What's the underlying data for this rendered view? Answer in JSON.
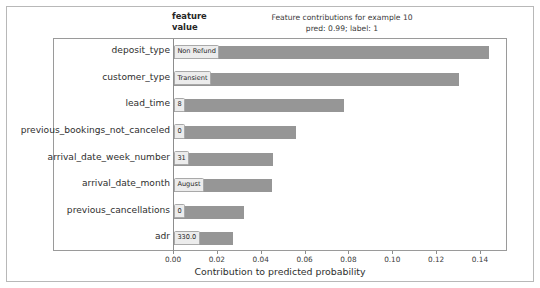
{
  "figure": {
    "header_feature_value": "feature\nvalue",
    "title_line1": "Feature contributions for example 10",
    "title_line2": "pred: 0.99; label: 1",
    "xlabel": "Contribution to predicted probability",
    "bar_color": "#969696",
    "value_box_bg": "#ececec",
    "value_box_border": "#a9a9a9",
    "axis_color": "#8d8d8d",
    "frame_color": "#b8b8b8"
  },
  "chart_data": {
    "type": "bar",
    "orientation": "horizontal",
    "title": "Feature contributions for example 10\npred: 0.99; label: 1",
    "xlabel": "Contribution to predicted probability",
    "ylabel": "",
    "xlim": [
      0.0,
      0.1505
    ],
    "grid": false,
    "legend": null,
    "xticks": [
      "0.00",
      "0.02",
      "0.04",
      "0.06",
      "0.08",
      "0.10",
      "0.12",
      "0.14"
    ],
    "xtick_values": [
      0.0,
      0.02,
      0.04,
      0.06,
      0.08,
      0.1,
      0.12,
      0.14
    ],
    "categories": [
      "deposit_type",
      "customer_type",
      "lead_time",
      "previous_bookings_not_canceled",
      "arrival_date_week_number",
      "arrival_date_month",
      "previous_cancellations",
      "adr"
    ],
    "values": [
      0.1435,
      0.13,
      0.0775,
      0.0557,
      0.045,
      0.0448,
      0.0321,
      0.027
    ],
    "feature_values": [
      "Non Refund",
      "Transient",
      "8",
      "0",
      "31",
      "August",
      "0",
      "330.0"
    ],
    "prediction": "0.99",
    "label": "1",
    "example_index": "10"
  },
  "rows": [
    {
      "feature": "deposit_type",
      "value": "Non Refund",
      "contribution": 0.1435
    },
    {
      "feature": "customer_type",
      "value": "Transient",
      "contribution": 0.13
    },
    {
      "feature": "lead_time",
      "value": "8",
      "contribution": 0.0775
    },
    {
      "feature": "previous_bookings_not_canceled",
      "value": "0",
      "contribution": 0.0557
    },
    {
      "feature": "arrival_date_week_number",
      "value": "31",
      "contribution": 0.045
    },
    {
      "feature": "arrival_date_month",
      "value": "August",
      "contribution": 0.0448
    },
    {
      "feature": "previous_cancellations",
      "value": "0",
      "contribution": 0.0321
    },
    {
      "feature": "adr",
      "value": "330.0",
      "contribution": 0.027
    }
  ]
}
